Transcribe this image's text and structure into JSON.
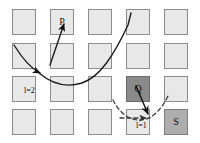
{
  "figure": {
    "title": "",
    "grid": {
      "rows": 4,
      "cols": 5,
      "cell_fill": "#e8e8e8",
      "cell_border": "#8c8c8c"
    },
    "cells": [
      {
        "id": "r1c1",
        "row": 1,
        "col": 1,
        "label": "",
        "shade": "light"
      },
      {
        "id": "r1c2",
        "row": 1,
        "col": 2,
        "label": "P",
        "shade": "light"
      },
      {
        "id": "r1c3",
        "row": 1,
        "col": 3,
        "label": "",
        "shade": "light"
      },
      {
        "id": "r1c4",
        "row": 1,
        "col": 4,
        "label": "",
        "shade": "light"
      },
      {
        "id": "r1c5",
        "row": 1,
        "col": 5,
        "label": "",
        "shade": "light"
      },
      {
        "id": "r2c1",
        "row": 2,
        "col": 1,
        "label": "",
        "shade": "light"
      },
      {
        "id": "r2c2",
        "row": 2,
        "col": 2,
        "label": "",
        "shade": "light"
      },
      {
        "id": "r2c3",
        "row": 2,
        "col": 3,
        "label": "",
        "shade": "light"
      },
      {
        "id": "r2c4",
        "row": 2,
        "col": 4,
        "label": "",
        "shade": "light"
      },
      {
        "id": "r2c5",
        "row": 2,
        "col": 5,
        "label": "",
        "shade": "light"
      },
      {
        "id": "r3c1",
        "row": 3,
        "col": 1,
        "label": "",
        "shade": "light"
      },
      {
        "id": "r3c2",
        "row": 3,
        "col": 2,
        "label": "",
        "shade": "light"
      },
      {
        "id": "r3c3",
        "row": 3,
        "col": 3,
        "label": "",
        "shade": "light"
      },
      {
        "id": "r3c4",
        "row": 3,
        "col": 4,
        "label": "Q",
        "shade": "dark"
      },
      {
        "id": "r3c5",
        "row": 3,
        "col": 5,
        "label": "",
        "shade": "light"
      },
      {
        "id": "r4c1",
        "row": 4,
        "col": 1,
        "label": "",
        "shade": "light"
      },
      {
        "id": "r4c2",
        "row": 4,
        "col": 2,
        "label": "",
        "shade": "light"
      },
      {
        "id": "r4c3",
        "row": 4,
        "col": 3,
        "label": "",
        "shade": "light"
      },
      {
        "id": "r4c4",
        "row": 4,
        "col": 4,
        "label": "",
        "shade": "light"
      },
      {
        "id": "r4c5",
        "row": 4,
        "col": 5,
        "label": "S",
        "shade": "medium"
      }
    ],
    "node_labels": {
      "p": "P",
      "q": "Q",
      "s": "S"
    },
    "annotations": [
      {
        "id": "l2",
        "text": "l=2",
        "x": 24,
        "y": 87
      },
      {
        "id": "l1",
        "text": "l=1",
        "x": 136,
        "y": 124
      }
    ],
    "curves": [
      {
        "id": "solid-trajectory",
        "style": "solid",
        "color": "#1d1d1d",
        "width": 1.4,
        "arrowheads": [
          "toward-P",
          "at-left-junction"
        ]
      },
      {
        "id": "dashed-trajectory",
        "style": "dashed",
        "color": "#3a3a3a",
        "width": 1.3,
        "arrowheads": [
          "at-junction"
        ]
      },
      {
        "id": "q-arrow",
        "style": "solid",
        "color": "#111111",
        "width": 1.5,
        "arrowheads": [
          "at-junction"
        ]
      }
    ],
    "colors": {
      "light_cell": "#e8e8e8",
      "dark_cell": "#8a8a8a",
      "medium_cell": "#adadad",
      "stroke": "#1d1d1d",
      "background": "#ffffff"
    }
  }
}
